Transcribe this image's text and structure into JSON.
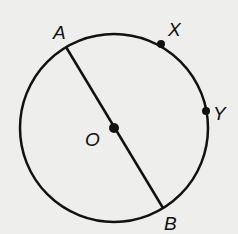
{
  "diagram": {
    "type": "circle-geometry",
    "circle": {
      "center_label": "O",
      "cx": 114,
      "cy": 128,
      "r": 94
    },
    "points": [
      {
        "label": "A",
        "x": 66,
        "y": 47,
        "label_x": 56,
        "label_y": 38
      },
      {
        "label": "X",
        "x": 161,
        "y": 44,
        "label_x": 168,
        "label_y": 35
      },
      {
        "label": "Y",
        "x": 206,
        "y": 111,
        "label_x": 214,
        "label_y": 120
      },
      {
        "label": "O",
        "x": 114,
        "y": 128,
        "label_x": 84,
        "label_y": 148
      },
      {
        "label": "B",
        "x": 163,
        "y": 208,
        "label_x": 164,
        "label_y": 230
      }
    ],
    "segments": [
      {
        "from": "A",
        "to": "B",
        "label": "diameter AB"
      }
    ],
    "colors": {
      "stroke": "#111111",
      "background": "#eeeeec"
    }
  },
  "labels": {
    "A": "A",
    "X": "X",
    "Y": "Y",
    "O": "O",
    "B": "B"
  }
}
